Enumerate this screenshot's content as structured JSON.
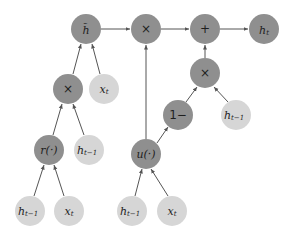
{
  "diagram": {
    "type": "computation-graph",
    "colors": {
      "operation_node": "#8f8f8f",
      "input_node": "#d6d6d6",
      "edge": "#555555",
      "text": "#1e1e1e"
    },
    "nodes": {
      "h_tilde": {
        "label": "h̃",
        "kind": "operation"
      },
      "mul_top": {
        "label": "×",
        "kind": "operation"
      },
      "plus": {
        "label": "+",
        "kind": "operation"
      },
      "h_t": {
        "label": "h",
        "sub": "t",
        "kind": "operation"
      },
      "mul_right": {
        "label": "×",
        "kind": "operation"
      },
      "one_minus": {
        "label": "1−",
        "kind": "operation"
      },
      "h_prev_right": {
        "label": "h",
        "sub": "t−1",
        "kind": "input"
      },
      "mul_left": {
        "label": "×",
        "kind": "operation"
      },
      "x_t_upper": {
        "label": "x",
        "sub": "t",
        "kind": "input"
      },
      "reset_gate": {
        "label": "r(·)",
        "kind": "operation"
      },
      "h_prev_mid": {
        "label": "h",
        "sub": "t−1",
        "kind": "input"
      },
      "update_gate": {
        "label": "u(·)",
        "kind": "operation"
      },
      "h_prev_bl": {
        "label": "h",
        "sub": "t−1",
        "kind": "input"
      },
      "x_t_bl": {
        "label": "x",
        "sub": "t",
        "kind": "input"
      },
      "h_prev_bm": {
        "label": "h",
        "sub": "t−1",
        "kind": "input"
      },
      "x_t_bm": {
        "label": "x",
        "sub": "t",
        "kind": "input"
      }
    },
    "edges": [
      [
        "h_prev_bl",
        "reset_gate"
      ],
      [
        "x_t_bl",
        "reset_gate"
      ],
      [
        "reset_gate",
        "mul_left"
      ],
      [
        "h_prev_mid",
        "mul_left"
      ],
      [
        "mul_left",
        "h_tilde"
      ],
      [
        "x_t_upper",
        "h_tilde"
      ],
      [
        "h_tilde",
        "mul_top"
      ],
      [
        "h_prev_bm",
        "update_gate"
      ],
      [
        "x_t_bm",
        "update_gate"
      ],
      [
        "update_gate",
        "mul_top"
      ],
      [
        "update_gate",
        "one_minus"
      ],
      [
        "one_minus",
        "mul_right"
      ],
      [
        "h_prev_right",
        "mul_right"
      ],
      [
        "mul_right",
        "plus"
      ],
      [
        "mul_top",
        "plus"
      ],
      [
        "plus",
        "h_t"
      ]
    ]
  }
}
